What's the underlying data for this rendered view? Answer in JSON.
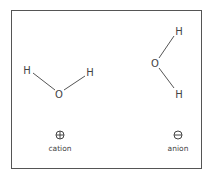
{
  "diagram": {
    "cation": {
      "molecule": {
        "atoms": [
          "H",
          "O",
          "H"
        ]
      },
      "symbol": "⊕",
      "label": "cation"
    },
    "anion": {
      "molecule": {
        "atoms": [
          "H",
          "O",
          "H"
        ]
      },
      "symbol": "⊖",
      "label": "anion"
    }
  }
}
